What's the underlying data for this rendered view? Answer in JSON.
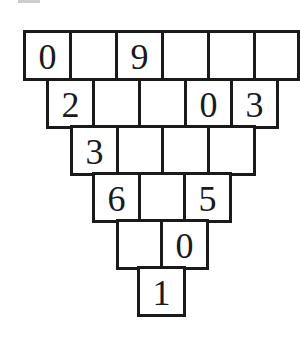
{
  "diagram": {
    "type": "number-pyramid",
    "rows": [
      {
        "cells": [
          "0",
          "",
          "9",
          "",
          "",
          ""
        ]
      },
      {
        "cells": [
          "2",
          "",
          "",
          "0",
          "3"
        ]
      },
      {
        "cells": [
          "3",
          "",
          "",
          ""
        ]
      },
      {
        "cells": [
          "6",
          "",
          "5"
        ]
      },
      {
        "cells": [
          "",
          "0"
        ]
      },
      {
        "cells": [
          "1"
        ]
      }
    ],
    "colors": {
      "border": "#1a1a1a",
      "text": "#1a1a1a",
      "background": "#ffffff"
    }
  }
}
